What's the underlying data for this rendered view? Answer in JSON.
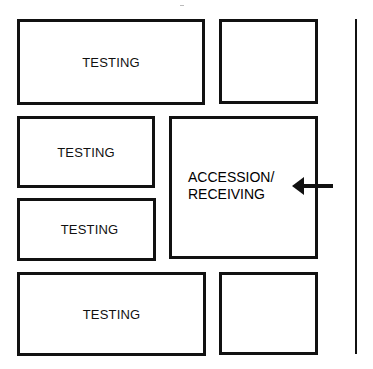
{
  "diagram": {
    "rooms": [
      {
        "id": "room-1",
        "label": "TESTING"
      },
      {
        "id": "room-2",
        "label": ""
      },
      {
        "id": "room-3",
        "label": "TESTING"
      },
      {
        "id": "room-4",
        "label": "TESTING"
      },
      {
        "id": "room-5",
        "label_line1": "ACCESSION/",
        "label_line2": "RECEIVING"
      },
      {
        "id": "room-6",
        "label": "TESTING"
      },
      {
        "id": "room-7",
        "label": ""
      }
    ],
    "arrow": {
      "direction": "left",
      "target": "ACCESSION/RECEIVING"
    },
    "colors": {
      "line": "#111111",
      "background": "#ffffff"
    }
  }
}
